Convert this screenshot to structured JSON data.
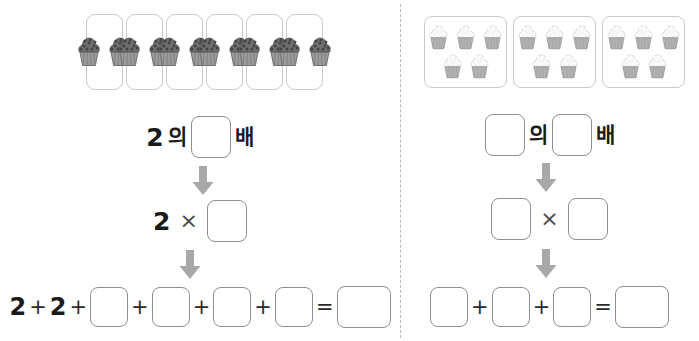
{
  "worksheet": {
    "title": "Multiplication as repeated addition worksheet",
    "divider_style": "dashed-vertical"
  },
  "icons": {
    "arrow": "down-arrow-icon",
    "cupcake_dark": "cupcake-chocolate-icon",
    "cupcake_light": "cupcake-vanilla-icon"
  },
  "colors": {
    "text": "#1a1a1a",
    "box_border": "#8e8e8e",
    "group_border": "#c9c9c9",
    "arrow": "#a8a8a8",
    "divider": "#b9b9b9"
  },
  "left": {
    "groups": {
      "count": 6,
      "per_group": 2,
      "frosting": "chocolate"
    },
    "row_korean": {
      "tokens": [
        {
          "type": "number",
          "text": "2"
        },
        {
          "type": "korean",
          "text": "의"
        },
        {
          "type": "blank",
          "size": "md"
        },
        {
          "type": "korean",
          "text": "배"
        }
      ]
    },
    "row_multiply": {
      "tokens": [
        {
          "type": "number",
          "text": "2"
        },
        {
          "type": "operator",
          "text": "×"
        },
        {
          "type": "blank",
          "size": "md"
        }
      ]
    },
    "row_addition": {
      "tokens": [
        {
          "type": "number",
          "text": "2"
        },
        {
          "type": "operator",
          "text": "+"
        },
        {
          "type": "number",
          "text": "2"
        },
        {
          "type": "operator",
          "text": "+"
        },
        {
          "type": "blank",
          "size": "sm"
        },
        {
          "type": "operator",
          "text": "+"
        },
        {
          "type": "blank",
          "size": "sm"
        },
        {
          "type": "operator",
          "text": "+"
        },
        {
          "type": "blank",
          "size": "sm"
        },
        {
          "type": "operator",
          "text": "+"
        },
        {
          "type": "blank",
          "size": "sm"
        },
        {
          "type": "operator",
          "text": "="
        },
        {
          "type": "blank",
          "size": "wide"
        }
      ]
    }
  },
  "right": {
    "groups": {
      "count": 3,
      "per_group": 5,
      "frosting": "vanilla"
    },
    "row_korean": {
      "tokens": [
        {
          "type": "blank",
          "size": "md"
        },
        {
          "type": "korean",
          "text": "의"
        },
        {
          "type": "blank",
          "size": "md"
        },
        {
          "type": "korean",
          "text": "배"
        }
      ]
    },
    "row_multiply": {
      "tokens": [
        {
          "type": "blank",
          "size": "md"
        },
        {
          "type": "operator",
          "text": "×"
        },
        {
          "type": "blank",
          "size": "md"
        }
      ]
    },
    "row_addition": {
      "tokens": [
        {
          "type": "blank",
          "size": "sm"
        },
        {
          "type": "operator",
          "text": "+"
        },
        {
          "type": "blank",
          "size": "sm"
        },
        {
          "type": "operator",
          "text": "+"
        },
        {
          "type": "blank",
          "size": "sm"
        },
        {
          "type": "operator",
          "text": "="
        },
        {
          "type": "blank",
          "size": "wide"
        }
      ]
    }
  }
}
